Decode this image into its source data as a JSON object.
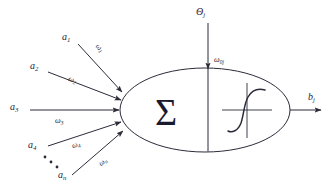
{
  "diagram": {
    "background_color": "#ffffff",
    "stroke_color": "#2b2b3a",
    "text_color": "#23233a",
    "body": {
      "summation_symbol": "Σ",
      "activation_icon": "sigmoid-curve"
    },
    "bias": {
      "source_label": "Θ",
      "source_sub": "j",
      "weight_label": "ω",
      "weight_sub": "0j"
    },
    "output": {
      "label": "b",
      "sub": "j"
    },
    "ellipsis": "…",
    "inputs": [
      {
        "name": "a",
        "sub": "1",
        "weight": "ω",
        "weight_sub": "1"
      },
      {
        "name": "a",
        "sub": "2",
        "weight": "ω",
        "weight_sub": "2"
      },
      {
        "name": "a",
        "sub": "3",
        "weight": "ω",
        "weight_sub": "3"
      },
      {
        "name": "a",
        "sub": "4",
        "weight": "ω",
        "weight_sub": "4"
      },
      {
        "name": "a",
        "sub": "n",
        "weight": "ω",
        "weight_sub": "n"
      }
    ]
  }
}
